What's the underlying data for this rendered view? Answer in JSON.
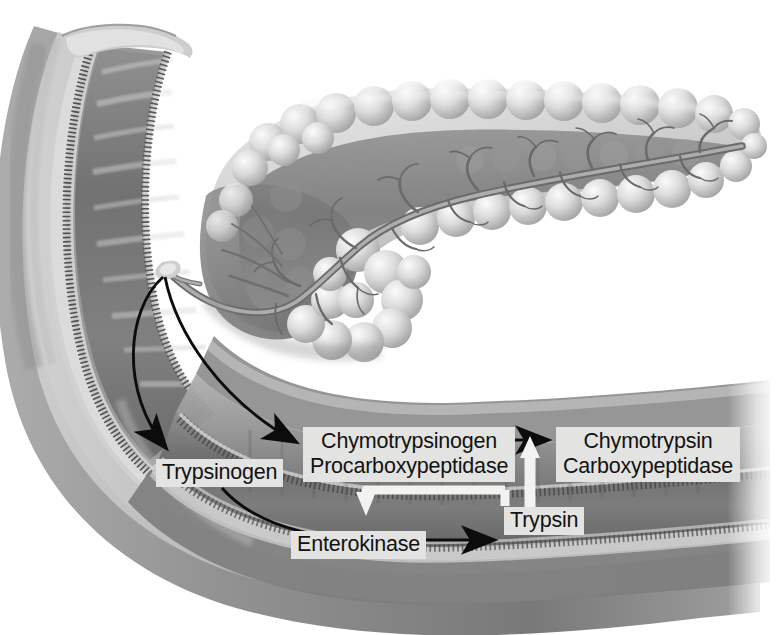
{
  "figure": {
    "anatomy": {
      "duodenum_label": "duodenum",
      "pancreas_label": "pancreas",
      "pancreatic_duct_label": "pancreatic duct",
      "papilla_label": "duodenal papilla"
    }
  },
  "labels": {
    "trypsinogen": "Trypsinogen",
    "chymotrypsinogen": "Chymotrypsinogen",
    "procarboxypeptidase": "Procarboxypeptidase",
    "chymotrypsin": "Chymotrypsin",
    "carboxypeptidase": "Carboxypeptidase",
    "enterokinase": "Enterokinase",
    "trypsin": "Trypsin"
  },
  "arrows": [
    {
      "name": "duct-to-trypsinogen",
      "from": "pancreatic-duct",
      "to": "Trypsinogen",
      "color": "#0c0c0c",
      "style": "curved-black"
    },
    {
      "name": "duct-to-chymotrypsinogen",
      "from": "pancreatic-duct",
      "to": "Chymotrypsinogen",
      "color": "#0c0c0c",
      "style": "curved-black"
    },
    {
      "name": "trypsinogen-to-enterokinase-path",
      "from": "Trypsinogen",
      "to": "Trypsin",
      "color": "#0c0c0c",
      "style": "curved-black"
    },
    {
      "name": "enterokinase-to-trypsin",
      "from": "Enterokinase",
      "to": "Trypsin",
      "color": "#0c0c0c",
      "style": "straight-black"
    },
    {
      "name": "chymotrypsinogen-to-chymotrypsin",
      "from": "Chymotrypsinogen",
      "to": "Chymotrypsin",
      "color": "#0c0c0c",
      "style": "straight-black"
    },
    {
      "name": "trypsin-activates-proenzymes",
      "from": "Trypsin",
      "to": "Chymotrypsinogen",
      "color": "#f2f2f0",
      "style": "white-hook-down"
    },
    {
      "name": "trypsin-catalyzes-conversion",
      "from": "Trypsin",
      "to": "Chymotrypsin",
      "color": "#f2f2f0",
      "style": "white-up"
    }
  ],
  "colors": {
    "label_background": "#e3e3e1",
    "label_text": "#121212",
    "black_arrow": "#0c0c0c",
    "white_arrow": "#f2f2f0",
    "tissue_mid": "#787878",
    "tissue_dark": "#5a5a5a",
    "tissue_light": "#c9c9c9",
    "page_background": "#ffffff"
  }
}
